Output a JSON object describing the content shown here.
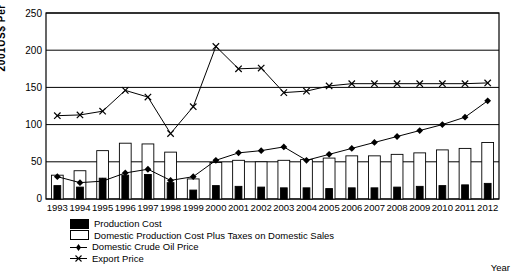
{
  "chart_data": {
    "type": "line",
    "title": "",
    "xlabel": "Year",
    "ylabel": "2001US$ Per Tonne",
    "ylim": [
      0,
      250
    ],
    "yticks": [
      0,
      50,
      100,
      150,
      200,
      250
    ],
    "grid": true,
    "legend_position": "bottom-left",
    "categories": [
      "1993",
      "1994",
      "1995",
      "1996",
      "1997",
      "1998",
      "1999",
      "2000",
      "2001",
      "2002",
      "2003",
      "2004",
      "2005",
      "2006",
      "2007",
      "2008",
      "2009",
      "2010",
      "2011",
      "2012"
    ],
    "series": [
      {
        "name": "Production Cost",
        "type": "bar",
        "style": "filled-black",
        "values": [
          18,
          16,
          28,
          32,
          33,
          22,
          12,
          18,
          17,
          16,
          15,
          15,
          14,
          15,
          15,
          16,
          17,
          18,
          19,
          21
        ]
      },
      {
        "name": "Domestic Production Cost Plus Taxes on Domestic Sales",
        "type": "bar",
        "style": "open-white",
        "values": [
          32,
          38,
          65,
          75,
          74,
          63,
          27,
          49,
          52,
          50,
          52,
          53,
          55,
          58,
          58,
          60,
          62,
          66,
          68,
          76
        ]
      },
      {
        "name": "Domestic Crude Oil Price",
        "type": "line",
        "marker": "diamond",
        "values": [
          30,
          22,
          24,
          35,
          40,
          25,
          30,
          52,
          62,
          65,
          70,
          52,
          60,
          68,
          76,
          84,
          92,
          100,
          110,
          132
        ]
      },
      {
        "name": "Export Price",
        "type": "line",
        "marker": "x",
        "values": [
          112,
          113,
          118,
          146,
          137,
          88,
          124,
          205,
          175,
          176,
          143,
          145,
          152,
          155,
          155,
          155,
          155,
          155,
          155,
          156
        ]
      }
    ]
  },
  "axis": {
    "y_tick_labels": [
      "250",
      "200",
      "150",
      "100",
      "50",
      "0"
    ],
    "x_tick_labels": [
      "1993",
      "1994",
      "1995",
      "1996",
      "1997",
      "1998",
      "1999",
      "2000",
      "2001",
      "2002",
      "2003",
      "2004",
      "2005",
      "2006",
      "2007",
      "2008",
      "2009",
      "2010",
      "2011",
      "2012"
    ],
    "x_axis_title": "Year",
    "y_axis_title": "2001US$ Per Tonne"
  },
  "legend": {
    "items": [
      {
        "label": "Production Cost",
        "key": "filled-square"
      },
      {
        "label": "Domestic Production Cost Plus Taxes on Domestic Sales",
        "key": "open-square"
      },
      {
        "label": "Domestic Crude Oil Price",
        "key": "diamond-line"
      },
      {
        "label": "Export Price",
        "key": "x-line"
      }
    ]
  },
  "colors": {
    "series_line": "#000000",
    "grid": "#000000",
    "bar_fill": "#000000",
    "bar_open": "#ffffff",
    "background": "#ffffff"
  }
}
